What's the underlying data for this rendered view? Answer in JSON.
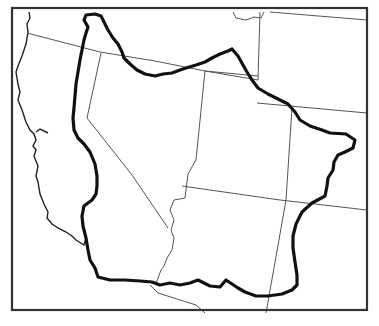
{
  "map": {
    "type": "outline-map",
    "description": "Region outline over western US state boundaries",
    "colors": {
      "background": "#ffffff",
      "frame": "#333333",
      "state_lines": "#555555",
      "coastline": "#222222",
      "region_outline": "#111111"
    }
  }
}
